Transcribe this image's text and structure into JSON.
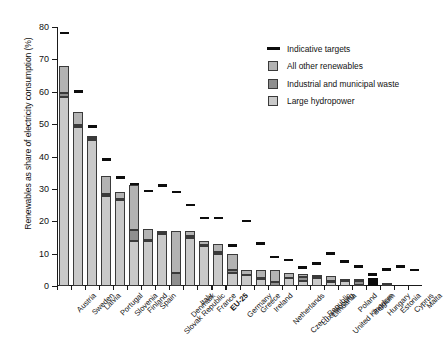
{
  "chart_data": {
    "type": "bar",
    "title": "",
    "xlabel": "",
    "ylabel": "Renewables as share of electricity consumption (%)",
    "ylim": [
      0,
      80
    ],
    "yticks": [
      0,
      10,
      20,
      30,
      40,
      50,
      60,
      70,
      80
    ],
    "grid": false,
    "stacked": true,
    "legend_position": "top-right",
    "legend": [
      {
        "key": "targets",
        "label": "Indicative targets",
        "marker": "line",
        "color": "#0d0d0d"
      },
      {
        "key": "other",
        "label": "All other renewables",
        "marker": "box",
        "color": "#b3b3b3"
      },
      {
        "key": "waste",
        "label": "Industrial and municipal waste",
        "marker": "box",
        "color": "#8f8f8f"
      },
      {
        "key": "hydro",
        "label": "Large hydropower",
        "marker": "box",
        "color": "#c9c9c9"
      }
    ],
    "categories": [
      "Austria",
      "Sweden",
      "Latvia",
      "Portugal",
      "Slovenia",
      "Finland",
      "Spain",
      "Slovak Republic",
      "Denmark",
      "Italy",
      "France",
      "EU-25",
      "Germany",
      "Greece",
      "Ireland",
      "Netherlands",
      "Czech Republic",
      "Luxembourg",
      "Lithuania",
      "United Kingdom",
      "Poland",
      "Belgium",
      "Hungary",
      "Estonia",
      "Cyprus",
      "Malta"
    ],
    "highlight_category": "EU-25",
    "series": [
      {
        "name": "Large hydropower",
        "values": [
          58.5,
          49.0,
          45.2,
          27.8,
          26.5,
          14.0,
          14.0,
          16.2,
          0.0,
          14.8,
          12.4,
          10.0,
          4.0,
          3.4,
          2.3,
          0.1,
          2.4,
          1.4,
          2.6,
          1.1,
          1.4,
          0.4,
          0.0,
          0.2,
          0.0,
          0.0
        ]
      },
      {
        "name": "Industrial and municipal waste",
        "values": [
          1.2,
          0.7,
          0.4,
          0.5,
          0.4,
          3.2,
          0.3,
          0.3,
          3.9,
          0.6,
          0.4,
          0.6,
          0.9,
          0.1,
          0.1,
          1.2,
          0.2,
          1.4,
          0.1,
          0.3,
          0.1,
          1.0,
          2.5,
          0.1,
          0.0,
          0.0
        ]
      },
      {
        "name": "All other renewables",
        "values": [
          8.3,
          4.0,
          0.4,
          5.7,
          2.1,
          14.0,
          3.2,
          0.5,
          13.1,
          1.6,
          1.2,
          2.4,
          5.1,
          1.5,
          2.6,
          3.7,
          1.4,
          0.8,
          0.6,
          1.6,
          0.5,
          0.8,
          0.0,
          0.4,
          0.0,
          0.0
        ]
      }
    ],
    "targets": {
      "name": "Indicative targets",
      "values": [
        78.1,
        60.0,
        49.3,
        39.0,
        33.6,
        31.5,
        29.4,
        31.0,
        29.0,
        25.0,
        21.0,
        21.0,
        12.5,
        20.1,
        13.2,
        9.0,
        8.0,
        5.7,
        7.0,
        10.0,
        7.5,
        6.0,
        3.6,
        5.1,
        6.0,
        5.0
      ]
    }
  }
}
